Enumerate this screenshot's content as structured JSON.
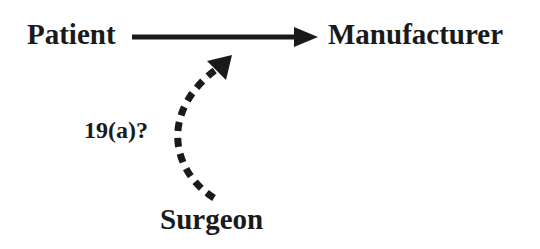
{
  "diagram": {
    "nodes": {
      "patient": "Patient",
      "manufacturer": "Manufacturer",
      "surgeon": "Surgeon"
    },
    "edges": [
      {
        "from": "Patient",
        "to": "Manufacturer",
        "style": "solid"
      },
      {
        "from": "Surgeon",
        "to": "Patient-Manufacturer link",
        "style": "dashed",
        "label": "19(a)?"
      }
    ],
    "edge_label": "19(a)?",
    "colors": {
      "ink": "#1a1a1a",
      "background": "#ffffff"
    }
  }
}
